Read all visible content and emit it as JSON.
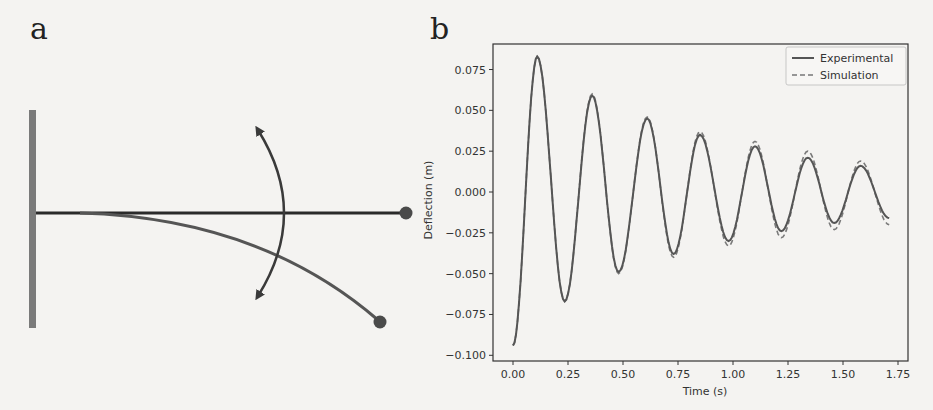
{
  "panels": {
    "a": {
      "label": "a",
      "diagram": {
        "description": "Cantilever beam fixed to a wall, shown straight and deflected, with a double-headed arc arrow indicating oscillation",
        "elements": [
          "wall",
          "straight-beam",
          "tip-mass-straight",
          "deflected-beam",
          "tip-mass-deflected",
          "oscillation-arrow"
        ],
        "colors": {
          "wall": "#7a7a7a",
          "beam": "#2a2a2a",
          "deflected": "#555555",
          "mass": "#4a4a4a"
        }
      }
    },
    "b": {
      "label": "b"
    }
  },
  "chart_data": {
    "type": "line",
    "title": "",
    "xlabel": "Time (s)",
    "ylabel": "Deflection (m)",
    "xlim": [
      -0.06,
      1.79
    ],
    "ylim": [
      -0.104,
      0.091
    ],
    "grid": false,
    "legend_position": "upper right",
    "x_ticks": [
      "0.00",
      "0.25",
      "0.50",
      "0.75",
      "1.00",
      "1.25",
      "1.50",
      "1.75"
    ],
    "y_ticks": [
      "0.075",
      "0.050",
      "0.025",
      "0.000",
      "−0.025",
      "−0.050",
      "−0.075",
      "−0.100"
    ],
    "x_tick_values": [
      0,
      0.25,
      0.5,
      0.75,
      1.0,
      1.25,
      1.5,
      1.75
    ],
    "y_tick_values": [
      0.075,
      0.05,
      0.025,
      0,
      -0.025,
      -0.05,
      -0.075,
      -0.1
    ],
    "legend": [
      "Experimental",
      "Simulation"
    ],
    "x": [
      0.0,
      0.11,
      0.235,
      0.36,
      0.48,
      0.61,
      0.73,
      0.85,
      0.98,
      1.1,
      1.22,
      1.34,
      1.46,
      1.58,
      1.71
    ],
    "series": [
      {
        "name": "Experimental",
        "style": "solid",
        "color": "#555555",
        "values": [
          -0.094,
          0.083,
          -0.067,
          0.059,
          -0.049,
          0.045,
          -0.038,
          0.035,
          -0.03,
          0.028,
          -0.024,
          0.021,
          -0.019,
          0.016,
          -0.016
        ]
      },
      {
        "name": "Simulation",
        "style": "dashed",
        "color": "#777777",
        "values": [
          -0.094,
          0.083,
          -0.067,
          0.06,
          -0.05,
          0.046,
          -0.04,
          0.037,
          -0.033,
          0.031,
          -0.028,
          0.025,
          -0.023,
          0.019,
          -0.02
        ]
      }
    ]
  }
}
